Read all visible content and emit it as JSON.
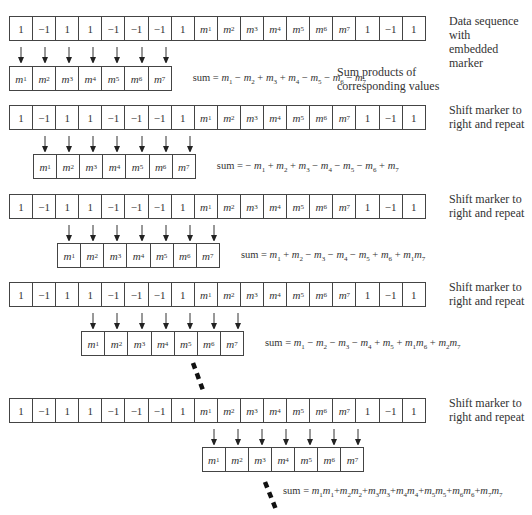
{
  "diagram": {
    "data_sequence": [
      "1",
      "-1",
      "1",
      "1",
      "-1",
      "-1",
      "-1",
      "1",
      "m1",
      "m2",
      "m3",
      "m4",
      "m5",
      "m6",
      "m7",
      "1",
      "-1",
      "1"
    ],
    "window": [
      "m1",
      "m2",
      "m3",
      "m4",
      "m5",
      "m6",
      "m7"
    ],
    "steps": [
      {
        "shift": 0,
        "label": "Data sequence with\nembedded marker",
        "sum": "sum = m1 − m2 + m3 + m4 − m5 − m6 − m7",
        "sum_terms": [
          [
            "",
            "m",
            "1"
          ],
          [
            "−",
            "m",
            "2"
          ],
          [
            "+",
            "m",
            "3"
          ],
          [
            "+",
            "m",
            "4"
          ],
          [
            "−",
            "m",
            "5"
          ],
          [
            "−",
            "m",
            "6"
          ],
          [
            "−",
            "m",
            "7"
          ]
        ],
        "note": "Sum products of\ncorresponding values"
      },
      {
        "shift": 1,
        "label": "Shift marker to\nright and repeat",
        "sum": "sum = −m1 + m2 + m3 − m4 − m5 − m6 + m7",
        "sum_terms": [
          [
            "−",
            "m",
            "1"
          ],
          [
            "+",
            "m",
            "2"
          ],
          [
            "+",
            "m",
            "3"
          ],
          [
            "−",
            "m",
            "4"
          ],
          [
            "−",
            "m",
            "5"
          ],
          [
            "−",
            "m",
            "6"
          ],
          [
            "+",
            "m",
            "7"
          ]
        ]
      },
      {
        "shift": 2,
        "label": "Shift marker to\nright and repeat",
        "sum": "sum = m1 + m2 − m3 − m4 − m5 + m6 + m1m7",
        "sum_terms": [
          [
            "",
            "m",
            "1"
          ],
          [
            "+",
            "m",
            "2"
          ],
          [
            "−",
            "m",
            "3"
          ],
          [
            "−",
            "m",
            "4"
          ],
          [
            "−",
            "m",
            "5"
          ],
          [
            "+",
            "m",
            "6"
          ],
          [
            "+",
            "m1m",
            "7"
          ]
        ]
      },
      {
        "shift": 3,
        "label": "Shift marker to\nright and repeat",
        "sum": "sum = m1 − m2 − m3 − m4 + m5 + m1m6 + m2m7",
        "sum_terms": [
          [
            "",
            "m",
            "1"
          ],
          [
            "−",
            "m",
            "2"
          ],
          [
            "−",
            "m",
            "3"
          ],
          [
            "−",
            "m",
            "4"
          ],
          [
            "+",
            "m",
            "5"
          ],
          [
            "+",
            "m1m",
            "6"
          ],
          [
            "+",
            "m2m",
            "7"
          ]
        ]
      },
      {
        "shift": 8,
        "label": "Shift marker to\nright and repeat",
        "sum": "sum = m1m1 + m2m2 + m3m3 + m4m4 + m5m5 + m6m6 + m7m7",
        "sum_terms": [
          [
            "",
            "m1m",
            "1"
          ],
          [
            "+",
            "m2m",
            "2"
          ],
          [
            "+",
            "m3m",
            "3"
          ],
          [
            "+",
            "m4m",
            "4"
          ],
          [
            "+",
            "m5m",
            "5"
          ],
          [
            "+",
            "m6m",
            "6"
          ],
          [
            "+",
            "m7m",
            "7"
          ]
        ]
      }
    ],
    "sum_prefix": "sum = ",
    "colors": {
      "border": "#444444",
      "text": "#333333",
      "background": "#ffffff",
      "dash": "#111111"
    }
  }
}
